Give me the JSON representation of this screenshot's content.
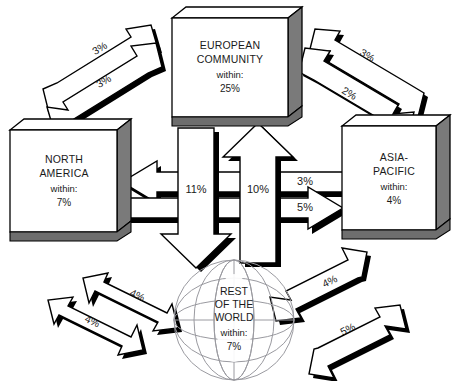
{
  "diagram": {
    "colors": {
      "outline": "#000000",
      "box_face": "#ffffff",
      "box_side": "#7a7a7a",
      "box_bottom": "#6e6e6e",
      "shadow": "#000000",
      "globe_line": "#9a9aa0",
      "text": "#1a1a1a",
      "background": "#ffffff"
    },
    "regions": [
      {
        "id": "european-community",
        "name_line1": "EUROPEAN",
        "name_line2": "COMMUNITY",
        "within_label": "within:",
        "within_value": "25%"
      },
      {
        "id": "north-america",
        "name_line1": "NORTH",
        "name_line2": "AMERICA",
        "within_label": "within:",
        "within_value": "7%"
      },
      {
        "id": "asia-pacific",
        "name_line1": "ASIA-",
        "name_line2": "PACIFIC",
        "within_label": "within:",
        "within_value": "4%"
      },
      {
        "id": "rest-of-the-world",
        "name_line1": "REST",
        "name_line2": "OF THE",
        "name_line3": "WORLD",
        "within_label": "within:",
        "within_value": "7%"
      }
    ],
    "flows": [
      {
        "id": "na-to-ec",
        "value": "3%",
        "from": "north-america",
        "to": "european-community",
        "position": "top-left-upper"
      },
      {
        "id": "ec-to-na",
        "value": "3%",
        "from": "european-community",
        "to": "north-america",
        "position": "top-left-lower"
      },
      {
        "id": "ap-to-ec",
        "value": "3%",
        "from": "asia-pacific",
        "to": "european-community",
        "position": "top-right-upper"
      },
      {
        "id": "ec-to-ap",
        "value": "2%",
        "from": "european-community",
        "to": "asia-pacific",
        "position": "top-right-lower"
      },
      {
        "id": "ec-to-row",
        "value": "11%",
        "from": "european-community",
        "to": "rest-of-the-world",
        "position": "center-down"
      },
      {
        "id": "row-to-ec",
        "value": "10%",
        "from": "rest-of-the-world",
        "to": "european-community",
        "position": "center-up"
      },
      {
        "id": "ap-to-na",
        "value": "3%",
        "from": "asia-pacific",
        "to": "north-america",
        "position": "center-left"
      },
      {
        "id": "na-to-ap",
        "value": "5%",
        "from": "north-america",
        "to": "asia-pacific",
        "position": "center-right"
      },
      {
        "id": "row-to-na",
        "value": "4%",
        "from": "rest-of-the-world",
        "to": "north-america",
        "position": "bottom-left-upper"
      },
      {
        "id": "na-to-row",
        "value": "4%",
        "from": "north-america",
        "to": "rest-of-the-world",
        "position": "bottom-left-lower"
      },
      {
        "id": "row-to-ap",
        "value": "4%",
        "from": "rest-of-the-world",
        "to": "asia-pacific",
        "position": "bottom-right-upper"
      },
      {
        "id": "ap-to-row",
        "value": "5%",
        "from": "asia-pacific",
        "to": "rest-of-the-world",
        "position": "bottom-right-lower"
      }
    ]
  }
}
